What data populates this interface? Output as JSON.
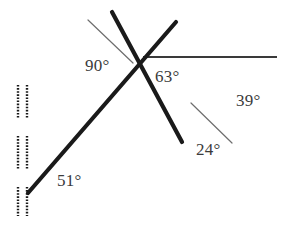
{
  "figure": {
    "canvas": {
      "width": 286,
      "height": 233,
      "background": "#ffffff"
    },
    "colors": {
      "thick_line": "#1a1a1a",
      "thin_line": "#6e6e6e",
      "tick_mark": "#1a1a1a",
      "label_text": "#3b3b3b"
    },
    "labels": [
      {
        "id": "angle-90",
        "text": "90°",
        "x": 85,
        "y": 57
      },
      {
        "id": "angle-63",
        "text": "63°",
        "x": 155,
        "y": 68
      },
      {
        "id": "angle-39",
        "text": "39°",
        "x": 236,
        "y": 92
      },
      {
        "id": "angle-24",
        "text": "24°",
        "x": 196,
        "y": 141
      },
      {
        "id": "angle-51",
        "text": "51°",
        "x": 57,
        "y": 172
      }
    ],
    "strokes": {
      "thick_width": 4.2,
      "thin_width": 1.2,
      "tick_width": 2.4
    },
    "lines": {
      "thick_descending": {
        "x1": 112,
        "y1": 12,
        "x2": 182,
        "y2": 142
      },
      "thick_ascending": {
        "x1": 28,
        "y1": 193,
        "x2": 176,
        "y2": 22
      },
      "horizontal_right": {
        "x1": 143,
        "y1": 57,
        "x2": 277,
        "y2": 57
      },
      "thin_upper_left": {
        "x1": 88,
        "y1": 20,
        "x2": 133,
        "y2": 63
      },
      "thin_lower_right": {
        "x1": 191,
        "y1": 103,
        "x2": 232,
        "y2": 143
      }
    },
    "intersection": {
      "x": 133,
      "y": 62
    },
    "parallel_marks": {
      "left_column_x": 18,
      "right_column_x": 27,
      "segments": [
        {
          "y1": 85,
          "y2": 119
        },
        {
          "y1": 136,
          "y2": 170
        },
        {
          "y1": 187,
          "y2": 216
        }
      ]
    }
  }
}
